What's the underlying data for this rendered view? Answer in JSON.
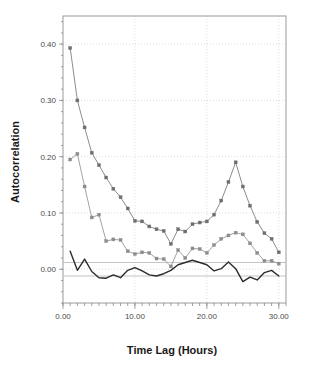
{
  "chart_data": {
    "type": "line",
    "title": "",
    "xlabel": "Time Lag (Hours)",
    "ylabel": "Autocorrelation",
    "xlim": [
      0,
      31
    ],
    "ylim": [
      -0.06,
      0.45
    ],
    "grid": true,
    "legend": "none",
    "x_ticks": [
      0,
      10,
      20,
      30
    ],
    "x_tick_labels": [
      "0.00",
      "10.00",
      "20.00",
      "30.00"
    ],
    "x_minor_tick_step": 1,
    "y_ticks": [
      0.0,
      0.1,
      0.2,
      0.3,
      0.4
    ],
    "y_tick_labels": [
      "0.00",
      "0.10",
      "0.20",
      "0.30",
      "0.40"
    ],
    "confidence_bands": [
      0.012,
      -0.012
    ],
    "x": [
      1,
      2,
      3,
      4,
      5,
      6,
      7,
      8,
      9,
      10,
      11,
      12,
      13,
      14,
      15,
      16,
      17,
      18,
      19,
      20,
      21,
      22,
      23,
      24,
      25,
      26,
      27,
      28,
      29,
      30
    ],
    "series": [
      {
        "name": "series-upper",
        "color": "#6e6e6e",
        "marker": "square",
        "values": [
          0.393,
          0.3,
          0.252,
          0.207,
          0.185,
          0.163,
          0.143,
          0.128,
          0.108,
          0.086,
          0.085,
          0.076,
          0.071,
          0.068,
          0.045,
          0.071,
          0.067,
          0.08,
          0.083,
          0.085,
          0.097,
          0.122,
          0.155,
          0.19,
          0.147,
          0.113,
          0.084,
          0.064,
          0.054,
          0.03
        ]
      },
      {
        "name": "series-middle",
        "color": "#8c8c8c",
        "marker": "square",
        "values": [
          0.195,
          0.205,
          0.147,
          0.092,
          0.097,
          0.05,
          0.053,
          0.052,
          0.032,
          0.027,
          0.03,
          0.029,
          0.019,
          0.018,
          0.005,
          0.034,
          0.02,
          0.037,
          0.036,
          0.029,
          0.043,
          0.054,
          0.06,
          0.065,
          0.062,
          0.046,
          0.029,
          0.015,
          0.015,
          0.01
        ]
      },
      {
        "name": "series-lower",
        "color": "#2b2b2b",
        "marker": "none",
        "values": [
          0.032,
          -0.002,
          0.018,
          -0.004,
          -0.015,
          -0.016,
          -0.01,
          -0.015,
          -0.002,
          0.003,
          -0.003,
          -0.01,
          -0.012,
          -0.008,
          -0.002,
          0.008,
          0.012,
          0.016,
          0.012,
          0.008,
          -0.003,
          0.001,
          0.013,
          0.001,
          -0.022,
          -0.014,
          -0.019,
          -0.006,
          -0.002,
          -0.012
        ]
      }
    ]
  }
}
